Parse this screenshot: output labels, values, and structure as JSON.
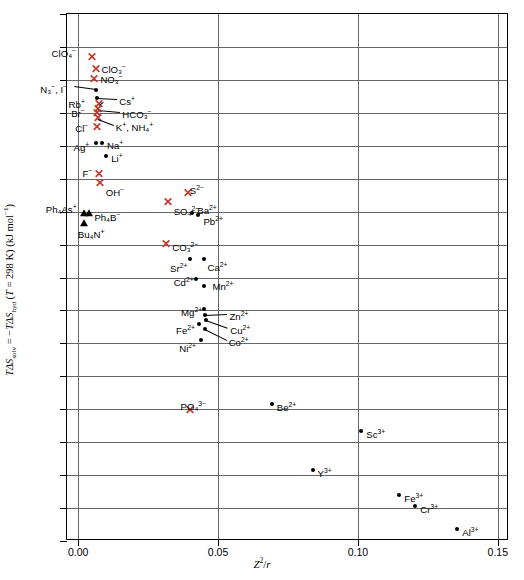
{
  "chart_data": {
    "type": "scatter",
    "title": "",
    "xlabel": "Z²/r",
    "ylabel": "TΔS_solv = −TΔS_hyd (T = 298 K) (kJ mol⁻¹)",
    "xlim": [
      -0.004,
      0.154
    ],
    "ylim": [
      -120,
      40
    ],
    "xticks": [
      "0.00",
      "0.05",
      "0.10",
      "0.15"
    ],
    "xtick_values": [
      0.0,
      0.05,
      0.1,
      0.15
    ],
    "yticks": [
      "+40",
      "0",
      "−40",
      "−80",
      "−120"
    ],
    "ytick_values": [
      40,
      0,
      -40,
      -80,
      -120
    ],
    "grid": "horizontal gridlines every 10 kJ/mol; vertical gridlines at each major x tick",
    "legend": "none",
    "marker_types": {
      "dot": "black filled circle — cations",
      "x": "red cross — anions",
      "triangle": "black filled triangle — large organic ions"
    },
    "points": [
      {
        "label": "ClO₄⁻",
        "marker": "x",
        "x": 0.0048,
        "y": 26.5,
        "lbl_dx": -40,
        "lbl_dy": -12
      },
      {
        "label": "ClO₃⁻",
        "marker": "x",
        "x": 0.0062,
        "y": 23.0,
        "lbl_dx": 6,
        "lbl_dy": -8
      },
      {
        "label": "NO₃⁻",
        "marker": "x",
        "x": 0.0058,
        "y": 20.0,
        "lbl_dx": 6,
        "lbl_dy": -8
      },
      {
        "label": "N₃⁻, I⁻",
        "marker": "dot",
        "x": 0.0065,
        "y": 17.0,
        "lbl_dx": -56,
        "lbl_dy": -8,
        "leader": true
      },
      {
        "label": "Cs⁺",
        "marker": "dot",
        "x": 0.0068,
        "y": 14.5,
        "lbl_dx": 22,
        "lbl_dy": -4,
        "leader": true
      },
      {
        "label": "Rb⁺",
        "marker": "x",
        "x": 0.0073,
        "y": 12.5,
        "lbl_dx": -30,
        "lbl_dy": -8,
        "leader": true
      },
      {
        "label": "HCO₃⁻",
        "marker": "x",
        "x": 0.0072,
        "y": 11.0,
        "lbl_dx": 24,
        "lbl_dy": -3,
        "leader": true
      },
      {
        "label": "Br⁻",
        "marker": "x",
        "x": 0.0068,
        "y": 9.5,
        "lbl_dx": -26,
        "lbl_dy": -8
      },
      {
        "label": "K⁺, NH₄⁺",
        "marker": "x",
        "x": 0.007,
        "y": 8.0,
        "lbl_dx": 18,
        "lbl_dy": 1,
        "leader": true
      },
      {
        "label": "Cl⁻",
        "marker": "x",
        "x": 0.0068,
        "y": 5.5,
        "lbl_dx": -22,
        "lbl_dy": -7
      },
      {
        "label": "Ag⁺",
        "marker": "dot",
        "x": 0.0062,
        "y": 0.8,
        "lbl_dx": -22,
        "lbl_dy": -3
      },
      {
        "label": "Na⁺",
        "marker": "dot",
        "x": 0.0085,
        "y": 0.8,
        "lbl_dx": 5,
        "lbl_dy": -5
      },
      {
        "label": "Li⁺",
        "marker": "dot",
        "x": 0.01,
        "y": -3.0,
        "lbl_dx": 5,
        "lbl_dy": -5
      },
      {
        "label": "F⁻",
        "marker": "x",
        "x": 0.0073,
        "y": -9.0,
        "lbl_dx": -16,
        "lbl_dy": -9
      },
      {
        "label": "OH⁻",
        "marker": "x",
        "x": 0.0077,
        "y": -11.5,
        "lbl_dx": 6,
        "lbl_dy": 1
      },
      {
        "label": "S²⁻",
        "marker": "x",
        "x": 0.0392,
        "y": -14.5,
        "lbl_dx": 2,
        "lbl_dy": -11
      },
      {
        "label": "SO₄²⁻",
        "marker": "x",
        "x": 0.032,
        "y": -17.5,
        "lbl_dx": 6,
        "lbl_dy": 1
      },
      {
        "label": "Ph₄As⁺",
        "marker": "tri",
        "x": 0.002,
        "y": -20.5,
        "lbl_dx": -38,
        "lbl_dy": -11
      },
      {
        "label": "Ph₄B⁻",
        "marker": "tri",
        "x": 0.004,
        "y": -20.5,
        "lbl_dx": 5,
        "lbl_dy": -3
      },
      {
        "label": "Ba²⁺",
        "marker": "dot",
        "x": 0.0408,
        "y": -20.5,
        "lbl_dx": 5,
        "lbl_dy": -10
      },
      {
        "label": "Pb²⁺",
        "marker": "dot",
        "x": 0.043,
        "y": -21.0,
        "lbl_dx": 5,
        "lbl_dy": -1
      },
      {
        "label": "Bu₄N⁺",
        "marker": "tri",
        "x": 0.002,
        "y": -23.5,
        "lbl_dx": -6,
        "lbl_dy": 4
      },
      {
        "label": "CO₃²⁻",
        "marker": "x",
        "x": 0.0315,
        "y": -30.0,
        "lbl_dx": 6,
        "lbl_dy": -5
      },
      {
        "label": "Sr²⁺",
        "marker": "dot",
        "x": 0.04,
        "y": -34.5,
        "lbl_dx": -20,
        "lbl_dy": 2
      },
      {
        "label": "Ca²⁺",
        "marker": "dot",
        "x": 0.0448,
        "y": -34.5,
        "lbl_dx": 4,
        "lbl_dy": 1
      },
      {
        "label": "Cd²⁺",
        "marker": "dot",
        "x": 0.042,
        "y": -40.5,
        "lbl_dx": -22,
        "lbl_dy": -4
      },
      {
        "label": "Mn²⁺",
        "marker": "dot",
        "x": 0.0448,
        "y": -42.5,
        "lbl_dx": 9,
        "lbl_dy": -7
      },
      {
        "label": "Mg²⁺",
        "marker": "dot",
        "x": 0.045,
        "y": -49.5,
        "lbl_dx": -23,
        "lbl_dy": -4
      },
      {
        "label": "Zn²⁺",
        "marker": "dot",
        "x": 0.0455,
        "y": -51.5,
        "lbl_dx": 24,
        "lbl_dy": -6,
        "leader": true
      },
      {
        "label": "Cu²⁺",
        "marker": "dot",
        "x": 0.0458,
        "y": -53.0,
        "lbl_dx": 24,
        "lbl_dy": 3,
        "leader": true
      },
      {
        "label": "Fe²⁺",
        "marker": "dot",
        "x": 0.0432,
        "y": -54.0,
        "lbl_dx": -23,
        "lbl_dy": -1
      },
      {
        "label": "Co²⁺",
        "marker": "dot",
        "x": 0.0452,
        "y": -55.5,
        "lbl_dx": 24,
        "lbl_dy": 6,
        "leader": true
      },
      {
        "label": "Ni²⁺",
        "marker": "dot",
        "x": 0.044,
        "y": -59.0,
        "lbl_dx": -22,
        "lbl_dy": 1
      },
      {
        "label": "PO₄³⁻",
        "marker": "x",
        "x": 0.0398,
        "y": -80.5,
        "lbl_dx": -9,
        "lbl_dy": -12
      },
      {
        "label": "Be²⁺",
        "marker": "dot",
        "x": 0.0692,
        "y": -78.5,
        "lbl_dx": 5,
        "lbl_dy": -4
      },
      {
        "label": "Sc³⁺",
        "marker": "dot",
        "x": 0.1012,
        "y": -86.5,
        "lbl_dx": 5,
        "lbl_dy": -4
      },
      {
        "label": "Y³⁺",
        "marker": "dot",
        "x": 0.0838,
        "y": -98.5,
        "lbl_dx": 5,
        "lbl_dy": -4
      },
      {
        "label": "Fe³⁺",
        "marker": "dot",
        "x": 0.1148,
        "y": -106.0,
        "lbl_dx": 5,
        "lbl_dy": -4
      },
      {
        "label": "Cr³⁺",
        "marker": "dot",
        "x": 0.1205,
        "y": -109.5,
        "lbl_dx": 5,
        "lbl_dy": -4
      },
      {
        "label": "Al³⁺",
        "marker": "dot",
        "x": 0.1355,
        "y": -116.5,
        "lbl_dx": 5,
        "lbl_dy": -4
      }
    ]
  },
  "axis": {
    "ylabel_parts": {
      "t1": "T",
      "ds1": "ΔS",
      "sub1": "solv",
      "eq": " = −",
      "t2": "T",
      "ds2": "ΔS",
      "sub2": "hyd",
      "cond": " (",
      "tvar": "T",
      "temp": " = 298 K) (kJ mol",
      "unit_sup": "−1",
      "close": ")"
    },
    "xlabel_parts": {
      "z": "Z",
      "sup": "2",
      "slash": "/",
      "r": "r"
    }
  }
}
